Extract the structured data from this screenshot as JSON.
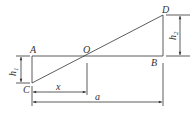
{
  "diagram": {
    "points": {
      "A": "A",
      "B": "B",
      "C": "C",
      "D": "D",
      "O": "O"
    },
    "dimensions": {
      "h1": "h",
      "h1_sub": "1",
      "h2": "h",
      "h2_sub": "2",
      "x": "x",
      "a": "a"
    },
    "colors": {
      "line": "#333333",
      "background": "#ffffff"
    }
  }
}
